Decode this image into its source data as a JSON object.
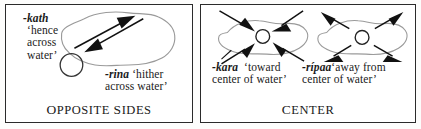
{
  "figure": {
    "panels": [
      {
        "id": "opposite-sides",
        "caption": "OPPOSITE SIDES",
        "caption_first_letters": "OS",
        "labels": [
          {
            "id": "kath",
            "morpheme": "-kath",
            "gloss_line1": "‘hence",
            "gloss_line2": "across",
            "gloss_line3": "water’"
          },
          {
            "id": "rina",
            "morpheme": "-rina",
            "gloss_line1": "‘hither",
            "gloss_line2": "across water’"
          }
        ],
        "shapes": {
          "water_blob": "irregular-lake-outline",
          "observer_circle": "small-open-circle",
          "arrows": "two-parallel-opposing-diagonal-arrows"
        }
      },
      {
        "id": "center",
        "caption": "CENTER",
        "caption_first_letters": "C",
        "labels": [
          {
            "id": "kara",
            "morpheme": "-kara",
            "gloss_line1": "‘toward",
            "gloss_line2": "center of water’"
          },
          {
            "id": "ripaa",
            "morpheme": "-rípaa",
            "gloss_line1": "‘away from",
            "gloss_line2": "center of water’"
          }
        ],
        "shapes": {
          "water_blob_left": "irregular-lake-outline",
          "water_blob_right": "irregular-lake-outline",
          "center_circle_left": "small-open-circle",
          "center_circle_right": "small-open-circle",
          "arrows_left": "four-arrows-pointing-inward",
          "arrows_right": "four-arrows-pointing-outward"
        }
      }
    ]
  },
  "colors": {
    "ink": "#1a1a1a",
    "border": "#2b2b2b",
    "blob_outline": "#9a9a9a",
    "arrow": "#111111",
    "background": "#ffffff"
  }
}
